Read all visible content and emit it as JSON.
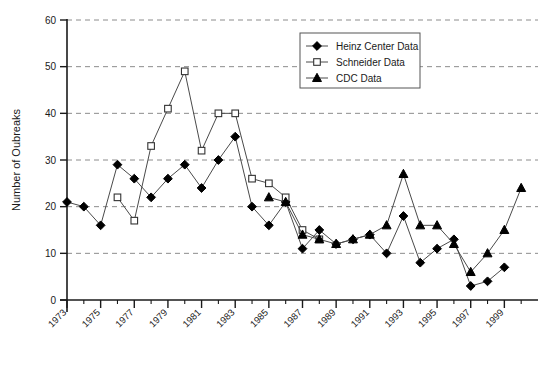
{
  "chart_data": {
    "type": "line",
    "title": "",
    "xlabel": "",
    "ylabel": "Number of Oubreaks",
    "ylim": [
      0,
      60
    ],
    "yticks": [
      0,
      10,
      20,
      30,
      40,
      50,
      60
    ],
    "xlim": [
      1973,
      2001
    ],
    "xticks": [
      1973,
      1975,
      1977,
      1979,
      1981,
      1983,
      1985,
      1987,
      1989,
      1991,
      1993,
      1995,
      1997,
      1999
    ],
    "xtick_labels": [
      "1973",
      "1975",
      "1977",
      "1979",
      "1981",
      "1983",
      "1985",
      "1987",
      "1989",
      "1991",
      "1993",
      "1995",
      "1997",
      "1999"
    ],
    "minor_xticks": [
      1974,
      1976,
      1978,
      1980,
      1982,
      1984,
      1986,
      1988,
      1990,
      1992,
      1994,
      1996,
      1998,
      2000
    ],
    "grid": "horizontal-dashed",
    "legend_position": "top-right",
    "series": [
      {
        "name": "Heinz Center Data",
        "marker": "filled-diamond",
        "x": [
          1973,
          1974,
          1975,
          1976,
          1977,
          1978,
          1979,
          1980,
          1981,
          1982,
          1983,
          1984,
          1985,
          1986,
          1987,
          1988,
          1989,
          1990,
          1991,
          1992,
          1993,
          1994,
          1995,
          1996,
          1997,
          1998,
          1999
        ],
        "values": [
          21,
          20,
          16,
          29,
          26,
          22,
          26,
          29,
          24,
          30,
          35,
          20,
          16,
          21,
          11,
          15,
          12,
          13,
          14,
          10,
          18,
          8,
          11,
          13,
          3,
          4,
          7
        ]
      },
      {
        "name": "Schneider Data",
        "marker": "open-square",
        "x": [
          1976,
          1977,
          1978,
          1979,
          1980,
          1981,
          1982,
          1983,
          1984,
          1985,
          1986,
          1987,
          1988
        ],
        "values": [
          22,
          17,
          33,
          41,
          49,
          32,
          40,
          40,
          26,
          25,
          22,
          15,
          13
        ]
      },
      {
        "name": "CDC Data",
        "marker": "filled-triangle",
        "x": [
          1985,
          1986,
          1987,
          1988,
          1989,
          1990,
          1991,
          1992,
          1993,
          1994,
          1995,
          1996,
          1997,
          1998,
          1999,
          2000
        ],
        "values": [
          22,
          21,
          14,
          13,
          12,
          13,
          14,
          16,
          27,
          16,
          16,
          12,
          6,
          10,
          15,
          24
        ]
      }
    ]
  },
  "legend": {
    "entries": [
      {
        "label": "Heinz Center Data"
      },
      {
        "label": "Schneider Data"
      },
      {
        "label": "CDC Data"
      }
    ]
  },
  "axis": {
    "y_title": "Number of Oubreaks"
  }
}
